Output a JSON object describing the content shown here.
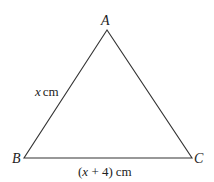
{
  "diagram": {
    "type": "triangle",
    "vertices": [
      {
        "name": "A",
        "x": 107,
        "y": 30
      },
      {
        "name": "B",
        "x": 24,
        "y": 158
      },
      {
        "name": "C",
        "x": 192,
        "y": 158
      }
    ],
    "labels": {
      "A": "A",
      "B": "B",
      "C": "C"
    },
    "sides": {
      "AB": {
        "var": "x",
        "unit": "cm"
      },
      "BC": {
        "open": "(",
        "var": "x",
        "rest": " + 4)",
        "unit": "cm"
      }
    },
    "colors": {
      "stroke": "#333333",
      "text": "#222222"
    }
  }
}
